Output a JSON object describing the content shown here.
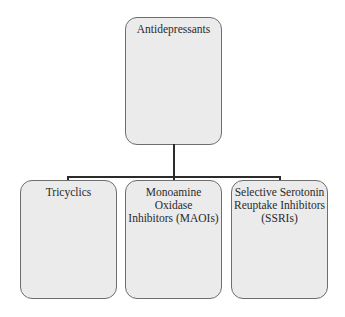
{
  "diagram": {
    "type": "hierarchy",
    "root": {
      "label": "Antidepressants"
    },
    "children": [
      {
        "label": "Tricyclics"
      },
      {
        "label": "Monoamine Oxidase Inhibitors (MAOIs)",
        "lines": [
          "Monoamine",
          "Oxidase",
          "Inhibitors (MAOIs)"
        ]
      },
      {
        "label": "Selective Serotonin Reuptake Inhibitors (SSRIs)",
        "lines": [
          "Selective Serotonin",
          "Reuptake Inhibitors",
          "(SSRIs)"
        ]
      }
    ],
    "colors": {
      "box_fill": "#ebebeb",
      "box_border": "#6e6e6e",
      "connector": "#2b2b2b"
    }
  }
}
